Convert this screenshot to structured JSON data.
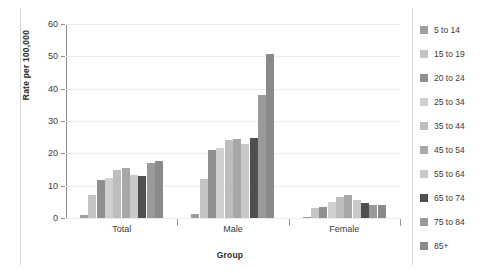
{
  "chart_data": {
    "type": "bar",
    "title": "",
    "xlabel": "Group",
    "ylabel": "Rate per 100,000",
    "categories": [
      "Total",
      "Male",
      "Female"
    ],
    "ylim": [
      0,
      60
    ],
    "yticks": [
      0,
      10,
      20,
      30,
      40,
      50,
      60
    ],
    "grid": true,
    "legend_position": "right",
    "series": [
      {
        "name": "5 to 14",
        "color": "#9d9d9d",
        "values": [
          1.0,
          1.3,
          0.4
        ]
      },
      {
        "name": "15 to 19",
        "color": "#c4c4c4",
        "values": [
          7.0,
          12.2,
          3.0
        ]
      },
      {
        "name": "20 to 24",
        "color": "#8f8f8f",
        "values": [
          11.9,
          21.0,
          3.4
        ]
      },
      {
        "name": "25 to 34",
        "color": "#d0d0d0",
        "values": [
          12.4,
          21.6,
          5.1
        ]
      },
      {
        "name": "35 to 44",
        "color": "#bdbdbd",
        "values": [
          14.9,
          24.1,
          6.4
        ]
      },
      {
        "name": "45 to 54",
        "color": "#a8a8a8",
        "values": [
          15.4,
          24.3,
          7.0
        ]
      },
      {
        "name": "55 to 64",
        "color": "#c9c9c9",
        "values": [
          13.2,
          23.0,
          5.5
        ]
      },
      {
        "name": "65 to 74",
        "color": "#4f4f4f",
        "values": [
          13.0,
          24.8,
          4.6
        ]
      },
      {
        "name": "75 to 84",
        "color": "#9a9a9a",
        "values": [
          17.0,
          38.0,
          4.1
        ]
      },
      {
        "name": "85+",
        "color": "#8a8a8a",
        "values": [
          17.5,
          50.8,
          4.0
        ]
      }
    ]
  },
  "legend": {
    "items": [
      {
        "label": "5 to 14",
        "color": "#9d9d9d"
      },
      {
        "label": "15 to 19",
        "color": "#c4c4c4"
      },
      {
        "label": "20 to 24",
        "color": "#8f8f8f"
      },
      {
        "label": "25 to 34",
        "color": "#d0d0d0"
      },
      {
        "label": "35 to 44",
        "color": "#bdbdbd"
      },
      {
        "label": "45 to 54",
        "color": "#a8a8a8"
      },
      {
        "label": "55 to 64",
        "color": "#c9c9c9"
      },
      {
        "label": "65 to 74",
        "color": "#4f4f4f"
      },
      {
        "label": "75 to 84",
        "color": "#9a9a9a"
      },
      {
        "label": "85+",
        "color": "#8a8a8a"
      }
    ]
  },
  "axes": {
    "y_label": "Rate per 100,000",
    "x_label": "Group",
    "y_tick_labels": [
      "0",
      "10",
      "20",
      "30",
      "40",
      "50",
      "60"
    ],
    "x_tick_labels": [
      "Total",
      "Male",
      "Female"
    ]
  },
  "colors": {
    "axis": "#8c8c8c",
    "grid": "#ececec",
    "text": "#3a3a3a",
    "label": "#2b2b2b",
    "background": "#ffffff",
    "rule": "#d6d6d6"
  }
}
